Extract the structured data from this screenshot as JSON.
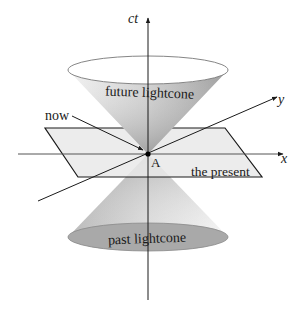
{
  "diagram": {
    "axes": {
      "time": {
        "label": "ct"
      },
      "x": {
        "label": "x"
      },
      "y": {
        "label": "y"
      }
    },
    "labels": {
      "future_cone": "future lightcone",
      "past_cone": "past lightcone",
      "present_plane": "the present",
      "event_point": "A",
      "now": "now"
    },
    "colors": {
      "line": "#1a1a1a",
      "cone_light": "#e6e6e6",
      "cone_dark": "#8f8f8f",
      "plane_fill": "#e9e9e9",
      "past_base": "#a9a9a9"
    }
  }
}
